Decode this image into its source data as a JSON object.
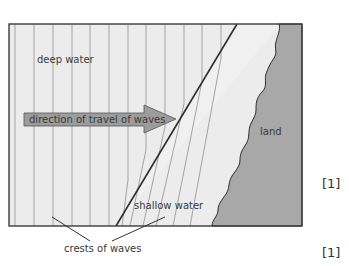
{
  "diagram": {
    "labels": {
      "deep_water": "deep water",
      "direction": "direction of travel of waves",
      "land": "land",
      "shallow_water": "shallow water",
      "crests": "crests of waves"
    },
    "colors": {
      "water": "#ececec",
      "shallow": "#efefef",
      "land": "#a9a9a9",
      "arrow": "#9a9a9a",
      "lines": "#9b9b9b",
      "border": "#3c3c3c"
    }
  },
  "marks": [
    "[1]",
    "[1]"
  ]
}
